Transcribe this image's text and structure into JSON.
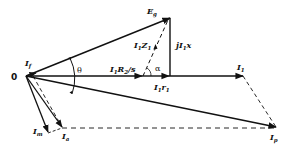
{
  "diagram": {
    "type": "phasor-diagram",
    "origin_label": "0",
    "colors": {
      "stroke": "#111111",
      "background": "#ffffff"
    },
    "phasors": [
      {
        "name": "E_g",
        "label": "E",
        "sub": "g",
        "style": "solid"
      },
      {
        "name": "I_1",
        "label": "I",
        "sub": "1",
        "style": "solid"
      },
      {
        "name": "I_p",
        "label": "I",
        "sub": "p",
        "style": "solid"
      },
      {
        "name": "I_m",
        "label": "I",
        "sub": "m",
        "style": "solid"
      },
      {
        "name": "I_a",
        "label": "I",
        "sub": "a",
        "style": "solid"
      },
      {
        "name": "I_f",
        "label": "I",
        "sub": "f",
        "style": "label-only"
      }
    ],
    "segments": [
      {
        "name": "I1R2/s",
        "label_pre": "I",
        "label_sub": "1",
        "label_post": "R",
        "label_sub2": "2",
        "label_tail": "/s"
      },
      {
        "name": "I1r1",
        "label_pre": "I",
        "label_sub": "1",
        "label_post": "r",
        "label_sub2": "1"
      },
      {
        "name": "jI1x",
        "label_pre": "jI",
        "label_sub": "1",
        "label_post": "x"
      },
      {
        "name": "I1Z1",
        "label_pre": "I",
        "label_sub": "1",
        "label_post": "Z",
        "label_sub2": "1",
        "style": "dashed"
      }
    ],
    "angles": [
      {
        "name": "theta",
        "symbol": "θ"
      },
      {
        "name": "alpha",
        "symbol": "α"
      }
    ]
  }
}
